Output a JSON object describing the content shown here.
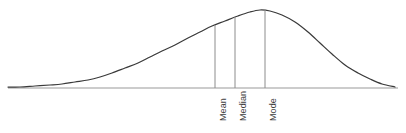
{
  "figure": {
    "width": 406,
    "height": 133,
    "background_color": "#ffffff",
    "curve_color": "#3a3a3a",
    "axis_color": "#9a9a9a",
    "marker_line_color": "#8c8c8c",
    "label_color": "#3d3d3d"
  },
  "chart_data": {
    "type": "line",
    "title": "",
    "subtitle": "",
    "xlabel": "",
    "ylabel": "",
    "grid": false,
    "legend": null,
    "skew": "left",
    "axis": {
      "baseline_y_px": 88,
      "x_start_px": 8,
      "x_end_px": 398,
      "visible": true
    },
    "x": [
      8,
      20,
      35,
      50,
      62,
      75,
      88,
      100,
      112,
      125,
      138,
      150,
      162,
      175,
      188,
      200,
      212,
      225,
      238,
      250,
      260,
      270,
      282,
      295,
      308,
      320,
      332,
      345,
      358,
      370,
      382,
      395
    ],
    "y_px": [
      87,
      87,
      86,
      85,
      84,
      82,
      80,
      77,
      73,
      68,
      63,
      57,
      51,
      45,
      38,
      32,
      26,
      21,
      16,
      12,
      10,
      11,
      15,
      22,
      32,
      43,
      54,
      65,
      73,
      79,
      84,
      87
    ],
    "annotations": [
      {
        "id": "mean",
        "label": "Mean",
        "x_px": 215,
        "curve_y_px": 25,
        "baseline_y_px": 88,
        "label_top_px": 90,
        "rotation_deg": -90
      },
      {
        "id": "median",
        "label": "Median",
        "x_px": 235,
        "curve_y_px": 17,
        "baseline_y_px": 88,
        "label_top_px": 90,
        "rotation_deg": -90
      },
      {
        "id": "mode",
        "label": "Mode",
        "x_px": 265,
        "curve_y_px": 10,
        "baseline_y_px": 88,
        "label_top_px": 90,
        "rotation_deg": -90
      }
    ]
  },
  "labels": {
    "mean": "Mean",
    "median": "Median",
    "mode": "Mode"
  }
}
